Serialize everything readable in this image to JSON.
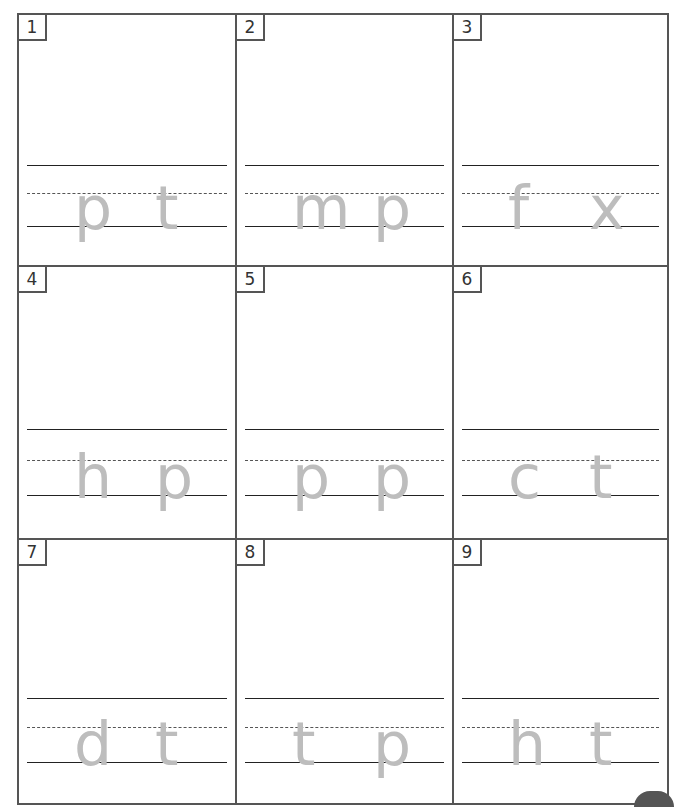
{
  "worksheet": {
    "cells": [
      {
        "number": "1",
        "letters": [
          "p",
          "t"
        ]
      },
      {
        "number": "2",
        "letters": [
          "m",
          "p"
        ]
      },
      {
        "number": "3",
        "letters": [
          "f",
          "x"
        ]
      },
      {
        "number": "4",
        "letters": [
          "h",
          "p"
        ]
      },
      {
        "number": "5",
        "letters": [
          "p",
          "p"
        ]
      },
      {
        "number": "6",
        "letters": [
          "c",
          "t"
        ]
      },
      {
        "number": "7",
        "letters": [
          "d",
          "t"
        ]
      },
      {
        "number": "8",
        "letters": [
          "t",
          "p"
        ]
      },
      {
        "number": "9",
        "letters": [
          "h",
          "t"
        ]
      }
    ]
  }
}
